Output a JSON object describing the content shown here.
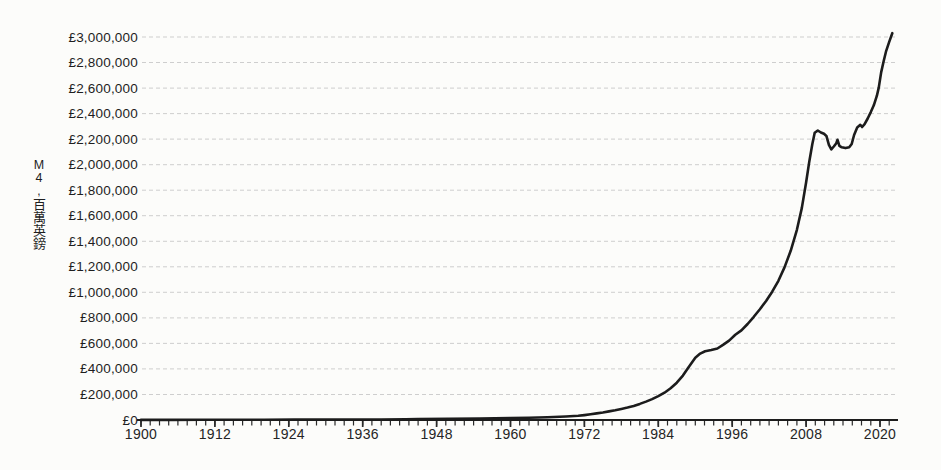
{
  "page": {
    "background": "#fcfcfa"
  },
  "chart_data": {
    "type": "line",
    "title": "",
    "xlabel": "",
    "ylabel": "M4,百萬英鎊",
    "ylabel_vertical_chars": [
      "M",
      "4",
      ",",
      "百",
      "萬",
      "英",
      "鎊"
    ],
    "y_tick_prefix": "£",
    "y_tick_values": [
      0,
      200000,
      400000,
      600000,
      800000,
      1000000,
      1200000,
      1400000,
      1600000,
      1800000,
      2000000,
      2200000,
      2400000,
      2600000,
      2800000,
      3000000
    ],
    "y_tick_labels": [
      "£0",
      "£200,000",
      "£400,000",
      "£600,000",
      "£800,000",
      "£1,000,000",
      "£1,200,000",
      "£1,400,000",
      "£1,600,000",
      "£1,800,000",
      "£2,000,000",
      "£2,200,000",
      "£2,400,000",
      "£2,600,000",
      "£2,800,000",
      "£3,000,000"
    ],
    "ylim": [
      0,
      3000000
    ],
    "x_tick_labels": [
      1900,
      1912,
      1924,
      1936,
      1948,
      1960,
      1972,
      1984,
      1996,
      2008,
      2020
    ],
    "x_minor_tick_step_years": 1.5,
    "xlim": [
      1900,
      2022.7
    ],
    "grid": "horizontal-dotted",
    "legend_position": "none",
    "series": [
      {
        "name": "M4",
        "points": [
          [
            1900,
            1000
          ],
          [
            1905,
            1150
          ],
          [
            1910,
            1300
          ],
          [
            1914,
            1600
          ],
          [
            1918,
            2400
          ],
          [
            1920,
            2700
          ],
          [
            1925,
            2850
          ],
          [
            1930,
            3000
          ],
          [
            1935,
            3400
          ],
          [
            1939,
            4300
          ],
          [
            1943,
            6500
          ],
          [
            1945,
            8000
          ],
          [
            1950,
            9800
          ],
          [
            1955,
            11800
          ],
          [
            1960,
            14500
          ],
          [
            1963,
            17500
          ],
          [
            1966,
            21500
          ],
          [
            1969,
            27500
          ],
          [
            1971,
            33000
          ],
          [
            1972,
            38000
          ],
          [
            1973,
            45000
          ],
          [
            1974,
            52000
          ],
          [
            1975,
            59000
          ],
          [
            1976,
            67000
          ],
          [
            1977,
            76000
          ],
          [
            1978,
            86000
          ],
          [
            1979,
            97000
          ],
          [
            1980,
            110000
          ],
          [
            1981,
            126000
          ],
          [
            1982,
            144000
          ],
          [
            1983,
            164000
          ],
          [
            1984,
            187000
          ],
          [
            1985,
            214000
          ],
          [
            1986,
            248000
          ],
          [
            1987,
            292000
          ],
          [
            1988,
            348000
          ],
          [
            1989,
            420000
          ],
          [
            1990,
            488000
          ],
          [
            1990.8,
            520000
          ],
          [
            1991.6,
            538000
          ],
          [
            1992.6,
            548000
          ],
          [
            1993.6,
            560000
          ],
          [
            1994.5,
            588000
          ],
          [
            1995.5,
            622000
          ],
          [
            1996.5,
            668000
          ],
          [
            1997.5,
            702000
          ],
          [
            1998.5,
            752000
          ],
          [
            1999.5,
            808000
          ],
          [
            2000.5,
            868000
          ],
          [
            2001.5,
            932000
          ],
          [
            2002.5,
            1005000
          ],
          [
            2003.5,
            1090000
          ],
          [
            2004.5,
            1195000
          ],
          [
            2005.5,
            1325000
          ],
          [
            2006.5,
            1490000
          ],
          [
            2007.3,
            1660000
          ],
          [
            2008,
            1860000
          ],
          [
            2008.5,
            2020000
          ],
          [
            2009,
            2160000
          ],
          [
            2009.4,
            2250000
          ],
          [
            2009.9,
            2268000
          ],
          [
            2010.4,
            2252000
          ],
          [
            2010.9,
            2242000
          ],
          [
            2011.3,
            2225000
          ],
          [
            2011.7,
            2155000
          ],
          [
            2012.1,
            2120000
          ],
          [
            2012.5,
            2142000
          ],
          [
            2012.9,
            2168000
          ],
          [
            2013.1,
            2195000
          ],
          [
            2013.4,
            2148000
          ],
          [
            2013.8,
            2136000
          ],
          [
            2014.4,
            2130000
          ],
          [
            2015,
            2136000
          ],
          [
            2015.4,
            2162000
          ],
          [
            2015.8,
            2232000
          ],
          [
            2016.3,
            2292000
          ],
          [
            2016.8,
            2312000
          ],
          [
            2017.1,
            2295000
          ],
          [
            2017.5,
            2318000
          ],
          [
            2018,
            2362000
          ],
          [
            2018.5,
            2412000
          ],
          [
            2019,
            2465000
          ],
          [
            2019.5,
            2540000
          ],
          [
            2019.8,
            2605000
          ],
          [
            2020.2,
            2725000
          ],
          [
            2020.6,
            2812000
          ],
          [
            2021,
            2892000
          ],
          [
            2021.5,
            2962000
          ],
          [
            2022,
            3030000
          ]
        ]
      }
    ],
    "colors": {
      "line": "#1c1c1c",
      "grid": "#c7c7c7",
      "axis": "#1c1c1c",
      "tick": "#2a2a2a",
      "text": "#1e1e1e",
      "background": "#fcfcfa"
    }
  }
}
